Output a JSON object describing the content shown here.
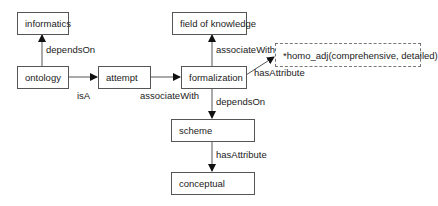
{
  "diagram": {
    "nodes": [
      {
        "id": "informatics",
        "label": "informatics"
      },
      {
        "id": "ontology",
        "label": "ontology"
      },
      {
        "id": "attempt",
        "label": "attempt"
      },
      {
        "id": "formalization",
        "label": "formalization"
      },
      {
        "id": "field_of_knowledge",
        "label": "field of knowledge"
      },
      {
        "id": "homo_adj",
        "label": "*homo_adj(comprehensive, detailed)"
      },
      {
        "id": "scheme",
        "label": "scheme"
      },
      {
        "id": "conceptual",
        "label": "conceptual"
      }
    ],
    "edges": [
      {
        "from": "ontology",
        "to": "informatics",
        "label": "dependsOn"
      },
      {
        "from": "ontology",
        "to": "attempt",
        "label": "isA"
      },
      {
        "from": "attempt",
        "to": "formalization",
        "label": "associateWith"
      },
      {
        "from": "formalization",
        "to": "field_of_knowledge",
        "label": "associateWith"
      },
      {
        "from": "formalization",
        "to": "homo_adj",
        "label": "hasAttribute"
      },
      {
        "from": "formalization",
        "to": "scheme",
        "label": "dependsOn"
      },
      {
        "from": "scheme",
        "to": "conceptual",
        "label": "hasAttribute"
      }
    ]
  }
}
